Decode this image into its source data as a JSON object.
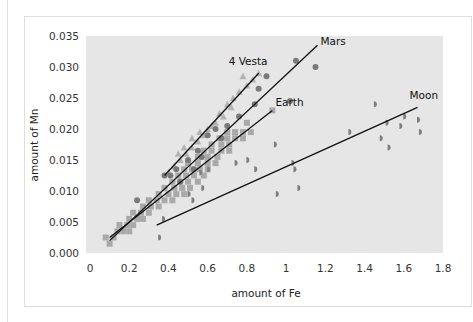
{
  "chart_data": {
    "type": "scatter",
    "title": "",
    "xlabel": "amount of Fe",
    "ylabel": "amount of Mn",
    "xlim": [
      0,
      1.8
    ],
    "ylim": [
      0,
      0.035
    ],
    "x_ticks": [
      "0",
      "0.2",
      "0.4",
      "0.6",
      "0.8",
      "1",
      "1.2",
      "1.4",
      "1.6",
      "1.8"
    ],
    "x_tick_values": [
      0,
      0.2,
      0.4,
      0.6,
      0.8,
      1.0,
      1.2,
      1.4,
      1.6,
      1.8
    ],
    "y_ticks": [
      "0.000",
      "0.005",
      "0.010",
      "0.015",
      "0.020",
      "0.025",
      "0.030",
      "0.035"
    ],
    "y_tick_values": [
      0,
      0.005,
      0.01,
      0.015,
      0.02,
      0.025,
      0.03,
      0.035
    ],
    "grid": false,
    "background": "#e6e6e6",
    "series": [
      {
        "name": "Earth",
        "marker": "square",
        "color": "#a9a9a9",
        "points": [
          [
            0.1,
            0.0015
          ],
          [
            0.08,
            0.0025
          ],
          [
            0.12,
            0.0025
          ],
          [
            0.14,
            0.0035
          ],
          [
            0.17,
            0.0035
          ],
          [
            0.2,
            0.0035
          ],
          [
            0.15,
            0.0045
          ],
          [
            0.19,
            0.0045
          ],
          [
            0.22,
            0.0045
          ],
          [
            0.2,
            0.0055
          ],
          [
            0.24,
            0.0055
          ],
          [
            0.27,
            0.0055
          ],
          [
            0.22,
            0.0065
          ],
          [
            0.26,
            0.0065
          ],
          [
            0.3,
            0.0065
          ],
          [
            0.27,
            0.0075
          ],
          [
            0.31,
            0.0075
          ],
          [
            0.35,
            0.0075
          ],
          [
            0.3,
            0.0085
          ],
          [
            0.34,
            0.0085
          ],
          [
            0.38,
            0.0085
          ],
          [
            0.42,
            0.0085
          ],
          [
            0.35,
            0.0095
          ],
          [
            0.4,
            0.0095
          ],
          [
            0.44,
            0.0095
          ],
          [
            0.48,
            0.0095
          ],
          [
            0.38,
            0.0105
          ],
          [
            0.43,
            0.0105
          ],
          [
            0.47,
            0.0105
          ],
          [
            0.51,
            0.0105
          ],
          [
            0.42,
            0.0115
          ],
          [
            0.46,
            0.0115
          ],
          [
            0.5,
            0.0115
          ],
          [
            0.55,
            0.0115
          ],
          [
            0.45,
            0.0125
          ],
          [
            0.49,
            0.0125
          ],
          [
            0.53,
            0.0125
          ],
          [
            0.58,
            0.0125
          ],
          [
            0.48,
            0.0135
          ],
          [
            0.52,
            0.0135
          ],
          [
            0.56,
            0.0135
          ],
          [
            0.6,
            0.0135
          ],
          [
            0.5,
            0.0145
          ],
          [
            0.55,
            0.0145
          ],
          [
            0.6,
            0.0145
          ],
          [
            0.64,
            0.0145
          ],
          [
            0.55,
            0.0155
          ],
          [
            0.6,
            0.0155
          ],
          [
            0.65,
            0.0155
          ],
          [
            0.58,
            0.0165
          ],
          [
            0.62,
            0.0165
          ],
          [
            0.67,
            0.0165
          ],
          [
            0.71,
            0.0165
          ],
          [
            0.62,
            0.0175
          ],
          [
            0.67,
            0.0175
          ],
          [
            0.71,
            0.0175
          ],
          [
            0.66,
            0.0185
          ],
          [
            0.7,
            0.0185
          ],
          [
            0.74,
            0.0185
          ],
          [
            0.78,
            0.0185
          ],
          [
            0.7,
            0.0195
          ],
          [
            0.74,
            0.0195
          ],
          [
            0.78,
            0.0195
          ],
          [
            0.82,
            0.0195
          ],
          [
            0.8,
            0.021
          ],
          [
            0.93,
            0.023
          ]
        ]
      },
      {
        "name": "4 Vesta",
        "marker": "triangle",
        "color": "#b3b3b3",
        "points": [
          [
            0.4,
            0.013
          ],
          [
            0.43,
            0.014
          ],
          [
            0.46,
            0.015
          ],
          [
            0.49,
            0.016
          ],
          [
            0.45,
            0.016
          ],
          [
            0.52,
            0.017
          ],
          [
            0.48,
            0.017
          ],
          [
            0.55,
            0.018
          ],
          [
            0.52,
            0.0185
          ],
          [
            0.58,
            0.019
          ],
          [
            0.6,
            0.02
          ],
          [
            0.64,
            0.021
          ],
          [
            0.68,
            0.022
          ],
          [
            0.7,
            0.024
          ],
          [
            0.73,
            0.025
          ],
          [
            0.76,
            0.026
          ],
          [
            0.8,
            0.027
          ],
          [
            0.83,
            0.028
          ],
          [
            0.86,
            0.029
          ],
          [
            0.78,
            0.0285
          ],
          [
            0.72,
            0.0235
          ],
          [
            0.62,
            0.0205
          ],
          [
            0.56,
            0.0195
          ],
          [
            0.66,
            0.0225
          ]
        ]
      },
      {
        "name": "Mars",
        "marker": "circle",
        "color": "#7a7a7a",
        "points": [
          [
            0.24,
            0.0085
          ],
          [
            0.38,
            0.0125
          ],
          [
            0.41,
            0.0125
          ],
          [
            0.44,
            0.0135
          ],
          [
            0.5,
            0.015
          ],
          [
            0.55,
            0.0165
          ],
          [
            0.6,
            0.019
          ],
          [
            0.64,
            0.02
          ],
          [
            0.7,
            0.0205
          ],
          [
            0.76,
            0.022
          ],
          [
            0.84,
            0.024
          ],
          [
            0.86,
            0.0265
          ],
          [
            0.9,
            0.0285
          ],
          [
            1.02,
            0.0245
          ],
          [
            1.05,
            0.031
          ],
          [
            1.15,
            0.03
          ],
          [
            0.46,
            0.0115
          ],
          [
            0.53,
            0.0135
          ],
          [
            0.57,
            0.0155
          ],
          [
            0.67,
            0.0185
          ]
        ]
      },
      {
        "name": "Moon",
        "marker": "half-circle",
        "color": "#7f7f7f",
        "points": [
          [
            0.35,
            0.0025
          ],
          [
            0.37,
            0.0055
          ],
          [
            0.5,
            0.0095
          ],
          [
            0.52,
            0.0085
          ],
          [
            0.56,
            0.013
          ],
          [
            0.57,
            0.0105
          ],
          [
            0.6,
            0.0135
          ],
          [
            0.74,
            0.0145
          ],
          [
            0.8,
            0.015
          ],
          [
            0.84,
            0.0135
          ],
          [
            0.94,
            0.0175
          ],
          [
            0.95,
            0.0095
          ],
          [
            1.03,
            0.0145
          ],
          [
            1.04,
            0.0135
          ],
          [
            1.06,
            0.0105
          ],
          [
            1.32,
            0.0195
          ],
          [
            1.45,
            0.024
          ],
          [
            1.48,
            0.0185
          ],
          [
            1.51,
            0.021
          ],
          [
            1.52,
            0.017
          ],
          [
            1.58,
            0.0205
          ],
          [
            1.6,
            0.022
          ],
          [
            1.67,
            0.0215
          ],
          [
            1.68,
            0.0195
          ]
        ]
      }
    ],
    "trend_lines": [
      {
        "name": "4 Vesta",
        "label": "4 Vesta",
        "from": [
          0.38,
          0.0125
        ],
        "to": [
          0.86,
          0.029
        ]
      },
      {
        "name": "Mars",
        "label": "Mars",
        "from": [
          0.1,
          0.002
        ],
        "to": [
          1.16,
          0.0335
        ]
      },
      {
        "name": "Earth",
        "label": "Earth",
        "from": [
          0.1,
          0.0025
        ],
        "to": [
          0.93,
          0.023
        ]
      },
      {
        "name": "Moon",
        "label": "Moon",
        "from": [
          0.34,
          0.0045
        ],
        "to": [
          1.67,
          0.0235
        ]
      }
    ]
  }
}
